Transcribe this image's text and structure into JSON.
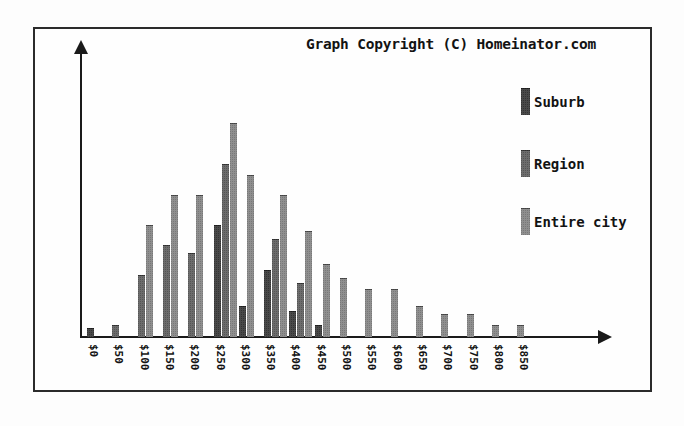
{
  "chart_data": {
    "type": "bar",
    "title": "Graph Copyright (C) Homeinator.com",
    "xlabel": "",
    "ylabel": "",
    "grid": false,
    "legend_position": "right",
    "categories": [
      "$0",
      "$50",
      "$100",
      "$150",
      "$200",
      "$250",
      "$300",
      "$350",
      "$400",
      "$450",
      "$500",
      "$550",
      "$600",
      "$650",
      "$700",
      "$750",
      "$800",
      "$850"
    ],
    "ylim": [
      0,
      100
    ],
    "series": [
      {
        "name": "Suburb",
        "color": "#4a4a4a",
        "values": [
          3,
          0,
          0,
          0,
          0,
          40,
          11,
          24,
          9,
          4,
          0,
          0,
          0,
          0,
          0,
          0,
          0,
          0
        ]
      },
      {
        "name": "Region",
        "color": "#6d6d6d",
        "values": [
          0,
          4,
          22,
          33,
          30,
          62,
          0,
          35,
          19,
          0,
          0,
          0,
          0,
          0,
          0,
          0,
          0,
          0
        ]
      },
      {
        "name": "Entire city",
        "color": "#8f8f8f",
        "values": [
          0,
          0,
          40,
          51,
          51,
          77,
          58,
          51,
          38,
          26,
          21,
          17,
          17,
          11,
          8,
          8,
          4,
          4
        ]
      }
    ]
  },
  "legend": {
    "items": [
      {
        "label": "Suburb"
      },
      {
        "label": "Region"
      },
      {
        "label": "Entire city"
      }
    ]
  },
  "axes": {
    "y_arrow": "arrow-up-icon",
    "x_arrow": "arrow-right-icon"
  }
}
